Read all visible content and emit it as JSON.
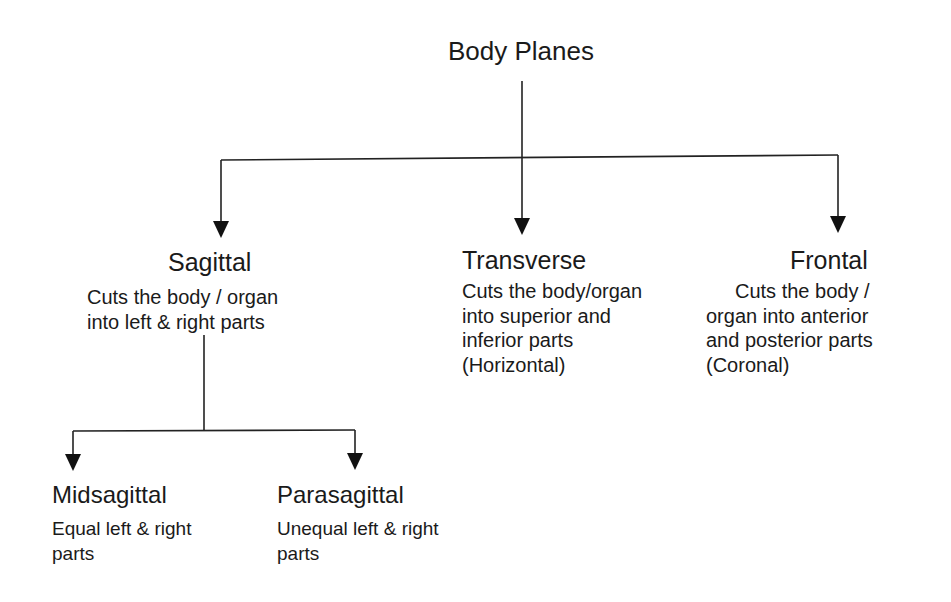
{
  "diagram": {
    "title": "Body Planes",
    "line_color": "#222222",
    "background": "#ffffff",
    "nodes": {
      "sagittal": {
        "title": "Sagittal",
        "desc_lines": [
          "Cuts the body / organ",
          "into left & right parts"
        ]
      },
      "transverse": {
        "title": "Transverse",
        "desc_lines": [
          "Cuts the body/organ",
          "into superior and",
          "inferior parts",
          "(Horizontal)"
        ]
      },
      "frontal": {
        "title": "Frontal",
        "desc_lines": [
          "Cuts the body /",
          "organ into anterior",
          "and posterior parts",
          "(Coronal)"
        ]
      },
      "midsagittal": {
        "title": "Midsagittal",
        "desc_lines": [
          "Equal left & right",
          "parts"
        ]
      },
      "parasagittal": {
        "title": "Parasagittal",
        "desc_lines": [
          "Unequal left & right",
          "parts"
        ]
      }
    },
    "edges": [
      {
        "from": "Body Planes",
        "to": "Sagittal"
      },
      {
        "from": "Body Planes",
        "to": "Transverse"
      },
      {
        "from": "Body Planes",
        "to": "Frontal"
      },
      {
        "from": "Sagittal",
        "to": "Midsagittal"
      },
      {
        "from": "Sagittal",
        "to": "Parasagittal"
      }
    ]
  }
}
